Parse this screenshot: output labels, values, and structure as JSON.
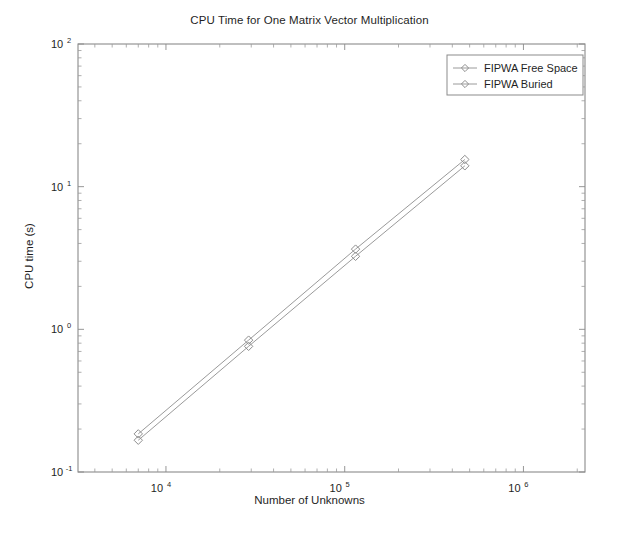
{
  "chart_data": {
    "type": "line",
    "title": "CPU Time for One Matrix Vector Multiplication",
    "xlabel": "Number of Unknowns",
    "ylabel": "CPU time (s)",
    "xscale": "log",
    "yscale": "log",
    "xlim": [
      3220,
      2210000
    ],
    "ylim": [
      0.1,
      100
    ],
    "grid": false,
    "legend_position": "top-right",
    "xticks": [
      10000,
      100000,
      1000000
    ],
    "xtick_labels": [
      "10⁴",
      "10⁵",
      "10⁶"
    ],
    "xtick_mantissa": [
      "10",
      "10",
      "10"
    ],
    "xtick_exponents": [
      "4",
      "5",
      "6"
    ],
    "yticks": [
      0.1,
      1,
      10,
      100
    ],
    "ytick_labels": [
      "10⁻¹",
      "10⁰",
      "10¹",
      "10²"
    ],
    "ytick_mantissa": [
      "10",
      "10",
      "10",
      "10"
    ],
    "ytick_exponents": [
      "-1",
      "0",
      "1",
      "2"
    ],
    "marker": "diamond",
    "series": [
      {
        "name": "FIPWA Free Space",
        "color": "#9a9a9a",
        "marker": "diamond",
        "x": [
          7000,
          29000,
          115000,
          470000
        ],
        "y": [
          0.185,
          0.84,
          3.65,
          15.5
        ]
      },
      {
        "name": "FIPWA Buried",
        "color": "#9a9a9a",
        "marker": "diamond",
        "x": [
          7000,
          29000,
          115000,
          470000
        ],
        "y": [
          0.167,
          0.76,
          3.25,
          14.0
        ]
      }
    ]
  },
  "legend": {
    "entries": [
      {
        "label": "FIPWA Free Space"
      },
      {
        "label": "FIPWA Buried"
      }
    ]
  }
}
